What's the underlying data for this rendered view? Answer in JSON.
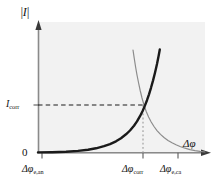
{
  "chart_data": {
    "type": "line",
    "title": "",
    "subtitle": "",
    "xlabel": "Δφ",
    "ylabel": "|I|",
    "grid": false,
    "legend": "none",
    "axes": {
      "x_ticks": [
        {
          "label_base": "Δφ",
          "label_sub": "e,an",
          "value": "Δφe,an",
          "px": 42
        },
        {
          "label_base": "Δφ",
          "label_sub": "corr",
          "value": "Δφcorr",
          "px": 142
        },
        {
          "label_base": "Δφ",
          "label_sub": "e,ca",
          "value": "Δφe,ca",
          "px": 178
        }
      ],
      "y_ticks": [
        {
          "label_base": "0",
          "label_sub": "",
          "value": "0",
          "px": 152
        },
        {
          "label_base": "I",
          "label_sub": "corr",
          "value": "Icorr",
          "px": 105
        }
      ],
      "origin_label": "0",
      "xlim_px": [
        38,
        205
      ],
      "ylim_px": [
        152,
        22
      ]
    },
    "series": [
      {
        "name": "anodic",
        "style": "solid-thick",
        "color": "#1a1a1a",
        "width": 2.4,
        "description": "anodic partial current rising exponentially from the anodic equilibrium potential",
        "path": "M 38 152.4 L 52 152.2 L 66 151.7 L 78 150.9 L 88 149.7 L 96 148.3 L 104 146.2 L 110 144.1 L 116 141.3 L 121 138.2 L 126 134.3 L 130 130.5 L 134 125.7 L 137 121.4 L 140 116.2 L 142.5 111.3 L 145 105.4 L 147 100.2 L 149 94.3 L 151 87.8 L 153 80.6 L 155 72.7 L 157 64.0 L 158.6 56.0 L 159.8 49.5"
      },
      {
        "name": "cathodic",
        "style": "solid-thin",
        "color": "#8c8c8c",
        "width": 1.2,
        "description": "cathodic partial current decaying exponentially toward the cathodic equilibrium potential",
        "path": "M 133.0 50.0 L 134.2 58.0 L 135.6 67.0 L 137.0 75.0 L 138.6 83.0 L 140.2 90.5 L 142.0 98.0 L 144.0 105.0 L 146.2 111.4 L 148.6 117.0 L 151.2 122.0 L 154.0 126.5 L 157.0 130.6 L 160.5 134.4 L 164.0 137.5 L 168.0 140.4 L 172.0 142.8 L 176.0 144.8 L 180.0 146.5 L 185.0 148.2 L 190.0 149.6 L 195.0 150.6 L 200.0 151.4 L 205.0 152.0"
      }
    ],
    "guides": [
      {
        "name": "icorr-horizontal-leader",
        "orientation": "horizontal",
        "style": "dashed",
        "color": "#1a1a1a",
        "x1": 38,
        "y1": 105,
        "x2": 143,
        "y2": 105
      },
      {
        "name": "phicorr-vertical-leader",
        "orientation": "vertical",
        "style": "dotted",
        "color": "#8c8c8c",
        "x1": 143,
        "y1": 105,
        "x2": 143,
        "y2": 154
      }
    ],
    "intersection": {
      "name": "corrosion-point",
      "x_px": 143,
      "y_px": 105,
      "x_label": "Δφcorr",
      "y_label": "Icorr"
    },
    "plot_area": {
      "background": "#f2f2f2",
      "x": 38,
      "y": 22,
      "width": 167,
      "height": 132
    },
    "colors": {
      "axis": "#8a8a8a",
      "anodic": "#1a1a1a",
      "cathodic": "#8c8c8c",
      "background": "#ffffff",
      "plot_background": "#f2f2f2",
      "text": "#111111"
    }
  }
}
